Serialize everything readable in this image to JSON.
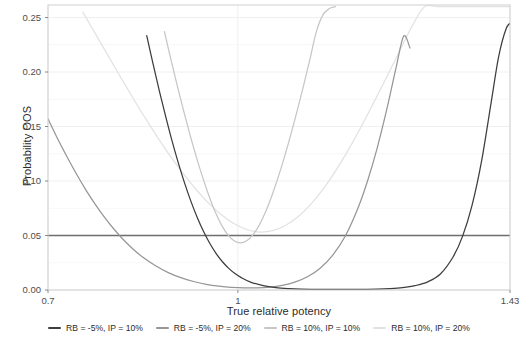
{
  "chart_data": {
    "type": "line",
    "title": "",
    "xlabel": "True relative potency",
    "ylabel": "Probability OOS",
    "xlim": [
      0.7,
      1.43
    ],
    "ylim": [
      0.0,
      0.2615
    ],
    "grid": true,
    "legend_position": "bottom",
    "xticks": [
      "0.7",
      "1",
      "1.43"
    ],
    "xtick_values": [
      0.7,
      1.0,
      1.43
    ],
    "yticks": [
      "0.00",
      "0.05",
      "0.10",
      "0.15",
      "0.20",
      "0.25"
    ],
    "ytick_values": [
      0.0,
      0.05,
      0.1,
      0.15,
      0.2,
      0.25
    ],
    "annotations": [
      {
        "type": "hline",
        "y": 0.05,
        "label": "",
        "color": "#6e6e6e"
      }
    ],
    "series": [
      {
        "name": "RB = -5%, IP = 10%",
        "color": "#3d3d3d",
        "x": [
          0.856,
          0.866,
          0.876,
          0.886,
          0.896,
          0.906,
          0.916,
          0.926,
          0.936,
          0.946,
          0.956,
          0.966,
          0.976,
          0.986,
          0.996,
          1.006,
          1.02,
          1.04,
          1.06,
          1.08,
          1.1,
          1.12,
          1.14,
          1.16,
          1.18,
          1.2,
          1.22,
          1.24,
          1.26,
          1.28,
          1.3,
          1.32,
          1.34,
          1.355,
          1.37,
          1.385,
          1.4,
          1.412,
          1.424,
          1.432
        ],
        "y": [
          0.2335,
          0.2075,
          0.1825,
          0.159,
          0.1368,
          0.1164,
          0.0978,
          0.0811,
          0.0663,
          0.0534,
          0.0424,
          0.0332,
          0.0257,
          0.0196,
          0.0148,
          0.0111,
          0.0073,
          0.004,
          0.0022,
          0.0013,
          0.0008,
          0.0006,
          0.0005,
          0.0005,
          0.0005,
          0.0006,
          0.0008,
          0.0013,
          0.0022,
          0.004,
          0.0075,
          0.0147,
          0.0303,
          0.0492,
          0.0776,
          0.118,
          0.1712,
          0.214,
          0.24,
          0.2452
        ]
      },
      {
        "name": "RB = -5%, IP = 20%",
        "color": "#969696",
        "x": [
          0.7,
          0.715,
          0.73,
          0.745,
          0.76,
          0.775,
          0.79,
          0.805,
          0.82,
          0.835,
          0.85,
          0.87,
          0.89,
          0.91,
          0.93,
          0.95,
          0.97,
          0.99,
          1.01,
          1.03,
          1.05,
          1.07,
          1.09,
          1.11,
          1.13,
          1.15,
          1.17,
          1.19,
          1.205,
          1.22,
          1.235,
          1.25,
          1.262,
          1.272
        ],
        "y": [
          0.157,
          0.139,
          0.1222,
          0.1064,
          0.0917,
          0.0783,
          0.0661,
          0.0553,
          0.0456,
          0.0372,
          0.03,
          0.0222,
          0.016,
          0.0113,
          0.0078,
          0.0052,
          0.0035,
          0.0024,
          0.0019,
          0.002,
          0.0027,
          0.0043,
          0.0072,
          0.0121,
          0.02,
          0.032,
          0.0498,
          0.0755,
          0.1003,
          0.13,
          0.165,
          0.204,
          0.233,
          0.222
        ]
      },
      {
        "name": "RB = 10%, IP = 10%",
        "color": "#c6c6c6",
        "x": [
          0.884,
          0.894,
          0.904,
          0.914,
          0.924,
          0.934,
          0.944,
          0.954,
          0.964,
          0.974,
          0.984,
          0.994,
          1.004,
          1.014,
          1.024,
          1.034,
          1.044,
          1.054,
          1.064,
          1.074,
          1.084,
          1.094,
          1.104,
          1.114,
          1.124,
          1.134,
          1.144,
          1.154
        ],
        "y": [
          0.237,
          0.212,
          0.188,
          0.165,
          0.1432,
          0.1228,
          0.104,
          0.087,
          0.072,
          0.0598,
          0.0508,
          0.0452,
          0.0432,
          0.0452,
          0.0508,
          0.0598,
          0.072,
          0.087,
          0.104,
          0.1228,
          0.1432,
          0.165,
          0.188,
          0.212,
          0.237,
          0.252,
          0.258,
          0.26
        ]
      },
      {
        "name": "RB = 10%, IP = 20%",
        "color": "#e2e2e2",
        "x": [
          0.755,
          0.775,
          0.795,
          0.815,
          0.835,
          0.855,
          0.875,
          0.895,
          0.915,
          0.935,
          0.955,
          0.975,
          0.995,
          1.015,
          1.035,
          1.055,
          1.075,
          1.095,
          1.115,
          1.135,
          1.155,
          1.175,
          1.195,
          1.215,
          1.235,
          1.255,
          1.275,
          1.295,
          1.315,
          1.335,
          1.355,
          1.375,
          1.395,
          1.415,
          1.43
        ],
        "y": [
          0.255,
          0.235,
          0.215,
          0.195,
          0.1755,
          0.1565,
          0.1385,
          0.1215,
          0.1058,
          0.0915,
          0.079,
          0.0685,
          0.0605,
          0.0553,
          0.0532,
          0.0545,
          0.0592,
          0.0672,
          0.0785,
          0.0928,
          0.1098,
          0.129,
          0.15,
          0.1722,
          0.1952,
          0.2185,
          0.2418,
          0.26,
          0.26,
          0.26,
          0.26,
          0.26,
          0.26,
          0.26,
          0.26
        ]
      }
    ]
  },
  "legend": {
    "items": [
      {
        "label": "RB = -5%, IP = 10%",
        "color": "#3d3d3d"
      },
      {
        "label": "RB = -5%, IP = 20%",
        "color": "#969696"
      },
      {
        "label": "RB = 10%, IP = 10%",
        "color": "#c6c6c6"
      },
      {
        "label": "RB = 10%, IP = 20%",
        "color": "#e2e2e2"
      }
    ]
  }
}
